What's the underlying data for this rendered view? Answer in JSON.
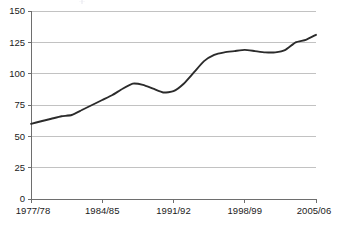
{
  "chart_data": {
    "type": "line",
    "title": "",
    "subtitle": "",
    "xlabel": "",
    "ylabel": "",
    "grid": true,
    "legend": false,
    "legend_position": "none",
    "ylim": [
      0,
      150
    ],
    "y_ticks": [
      0,
      25,
      50,
      75,
      100,
      125,
      150
    ],
    "y_tick_labels": [
      "0",
      "25",
      "50",
      "75",
      "100",
      "125",
      "150"
    ],
    "x_tick_labels": [
      "1977/78",
      "1984/85",
      "1991/92",
      "1998/99",
      "2005/06"
    ],
    "x_tick_values": [
      "1977/78",
      "1984/85",
      "1991/92",
      "1998/99",
      "2005/06"
    ],
    "xlim": [
      "1977/78",
      "2005/06"
    ],
    "line_color": "#2b2b2b",
    "grid_color": "#b3b3b3",
    "axis_color": "#6e6e6e",
    "categories": [
      "1977/78",
      "1978/79",
      "1979/80",
      "1980/81",
      "1981/82",
      "1982/83",
      "1983/84",
      "1984/85",
      "1985/86",
      "1986/87",
      "1987/88",
      "1988/89",
      "1989/90",
      "1990/91",
      "1991/92",
      "1992/93",
      "1993/94",
      "1994/95",
      "1995/96",
      "1996/97",
      "1997/98",
      "1998/99",
      "1999/00",
      "2000/01",
      "2001/02",
      "2002/03",
      "2003/04",
      "2004/05",
      "2005/06"
    ],
    "series": [
      {
        "name": "series-1",
        "values": [
          60,
          62,
          64,
          66,
          67,
          71,
          75,
          79,
          83,
          88,
          92,
          91,
          88,
          85,
          86,
          92,
          101,
          110,
          115,
          117,
          118,
          119,
          118,
          117,
          117,
          119,
          125,
          127,
          131
        ]
      }
    ]
  }
}
